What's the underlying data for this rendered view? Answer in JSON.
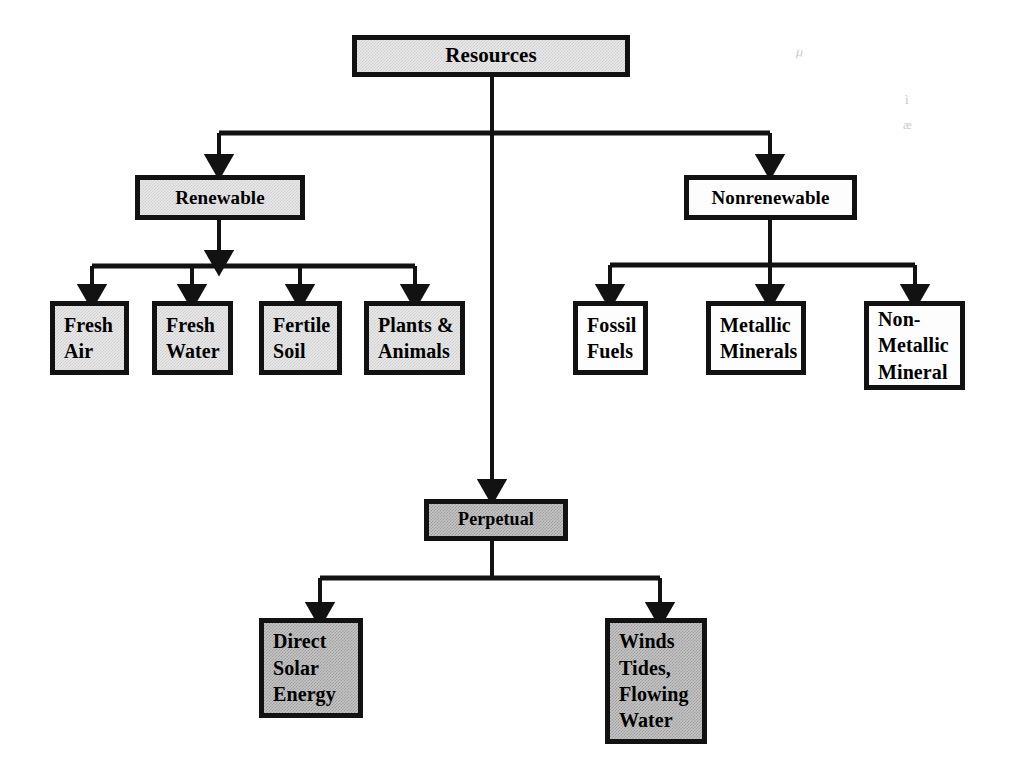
{
  "diagram": {
    "title": "Resources",
    "type": "hierarchy-tree",
    "background": "#ffffff",
    "line_color": "#121212",
    "border_color": "#121212",
    "fills": {
      "light_gray": "#e9e9e9",
      "white": "#fdfdfd",
      "mid_gray": "#c6c6c6"
    },
    "root": {
      "id": "resources",
      "label": "Resources",
      "fill": "light_gray"
    },
    "branches": [
      {
        "id": "renewable",
        "label": "Renewable",
        "fill": "light_gray",
        "children": [
          {
            "id": "fresh-air",
            "label": "Fresh\nAir",
            "fill": "light_gray"
          },
          {
            "id": "fresh-water",
            "label": "Fresh\nWater",
            "fill": "light_gray"
          },
          {
            "id": "fertile-soil",
            "label": "Fertile\nSoil",
            "fill": "light_gray"
          },
          {
            "id": "plants-animals",
            "label": "Plants &\nAnimals",
            "fill": "light_gray"
          }
        ]
      },
      {
        "id": "nonrenewable",
        "label": "Nonrenewable",
        "fill": "white",
        "children": [
          {
            "id": "fossil-fuels",
            "label": "Fossil\nFuels",
            "fill": "white"
          },
          {
            "id": "metallic-minerals",
            "label": "Metallic\nMinerals",
            "fill": "white"
          },
          {
            "id": "non-metallic-mineral",
            "label": "Non-\nMetallic\nMineral",
            "fill": "white"
          }
        ]
      },
      {
        "id": "perpetual",
        "label": "Perpetual",
        "fill": "mid_gray",
        "children": [
          {
            "id": "direct-solar-energy",
            "label": "Direct\nSolar\nEnergy",
            "fill": "mid_gray"
          },
          {
            "id": "winds-tides-flowing-water",
            "label": "Winds\nTides,\nFlowing\nWater",
            "fill": "mid_gray"
          }
        ]
      }
    ],
    "artifacts": [
      "µ",
      "ì",
      "æ"
    ]
  }
}
